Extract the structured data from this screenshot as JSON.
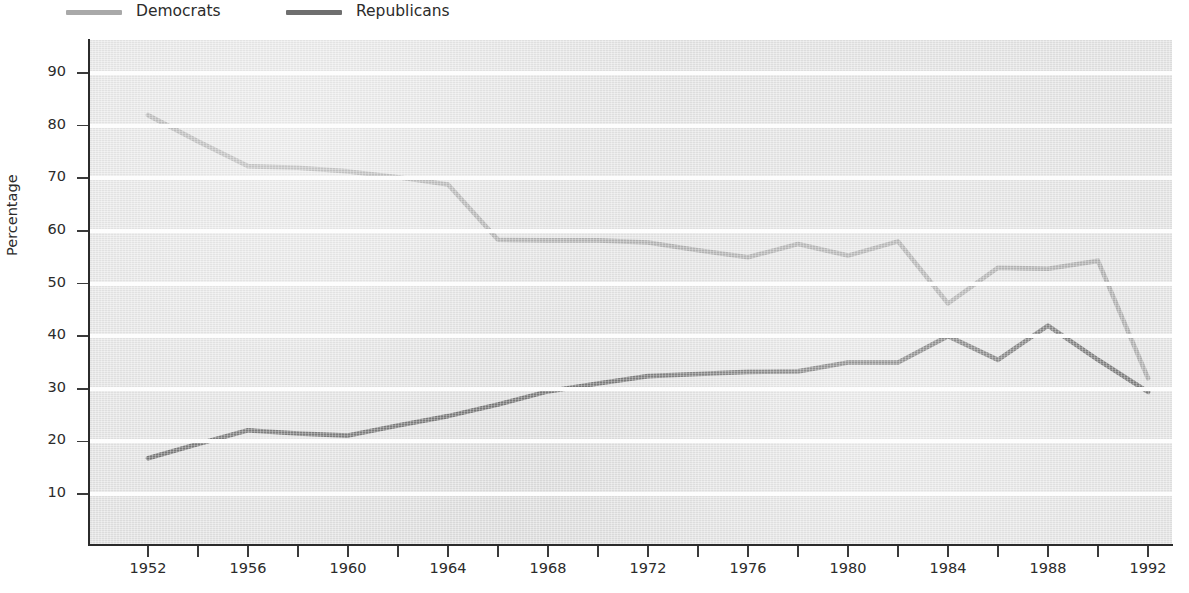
{
  "legend": {
    "position": "top-left",
    "items": [
      {
        "label": "Democrats",
        "color": "#a9a9a9"
      },
      {
        "label": "Republicans",
        "color": "#6f6f6f"
      }
    ]
  },
  "axes": {
    "ylabel": "Percentage",
    "xlabel": "",
    "ytick_labels": [
      "90",
      "80",
      "70",
      "60",
      "50",
      "40",
      "30",
      "20",
      "10"
    ],
    "xtick_labels": [
      "1952",
      "1956",
      "1960",
      "1964",
      "1968",
      "1972",
      "1976",
      "1980",
      "1984",
      "1988",
      "1992"
    ],
    "xtick_minor": [
      "1954",
      "1958",
      "1962",
      "1966",
      "1970",
      "1974",
      "1978",
      "1982",
      "1986",
      "1990"
    ],
    "ylim": [
      2,
      95
    ],
    "xlim": [
      1951,
      1993
    ],
    "grid": "horizontal-white-bands"
  },
  "style": {
    "plot_background": "#e3e3e3",
    "gridline_color": "#fdfdfd",
    "axis_color": "#2b2b2b",
    "text_color": "#2b2b2b"
  },
  "chart_data": {
    "type": "line",
    "title": "",
    "subtitle": "",
    "xlabel": "",
    "ylabel": "Percentage",
    "xlim": [
      1951,
      1993
    ],
    "ylim": [
      2,
      95
    ],
    "grid": true,
    "legend_position": "top-left",
    "x": [
      1952,
      1954,
      1956,
      1958,
      1960,
      1962,
      1964,
      1966,
      1968,
      1970,
      1972,
      1974,
      1976,
      1978,
      1980,
      1982,
      1984,
      1986,
      1988,
      1990,
      1992
    ],
    "series": [
      {
        "name": "Democrats",
        "color": "#a9a9a9",
        "values": [
          82.0,
          77.0,
          72.3,
          72.0,
          71.3,
          70.2,
          68.8,
          58.3,
          58.2,
          58.2,
          57.8,
          56.3,
          55.0,
          57.5,
          55.3,
          58.0,
          46.2,
          53.0,
          52.8,
          54.3,
          32.0
        ]
      },
      {
        "name": "Republicans",
        "color": "#6f6f6f",
        "values": [
          16.8,
          19.5,
          22.1,
          21.5,
          21.1,
          23.0,
          24.8,
          27.0,
          29.5,
          31.0,
          32.4,
          32.8,
          33.2,
          33.3,
          35.0,
          35.0,
          40.0,
          35.5,
          42.0,
          35.5,
          29.4
        ]
      }
    ],
    "annotations": []
  }
}
